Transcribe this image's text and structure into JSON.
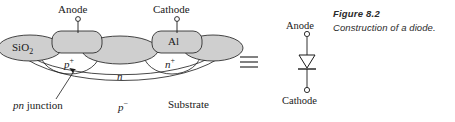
{
  "figure": {
    "caption_title": "Figure 8.2",
    "caption_text": "Construction of a diode."
  },
  "equivalence_symbol": "≡",
  "cross_section": {
    "terminals": [
      {
        "name": "anode",
        "label": "Anode"
      },
      {
        "name": "cathode",
        "label": "Cathode"
      }
    ],
    "regions": [
      {
        "name": "oxide-left",
        "label": "SiO",
        "subscript": "2"
      },
      {
        "name": "metal-anode",
        "label": ""
      },
      {
        "name": "p-plus",
        "label": "p",
        "superscript": "+"
      },
      {
        "name": "n-region",
        "label": "n"
      },
      {
        "name": "metal-cathode",
        "label": "Al"
      },
      {
        "name": "n-plus",
        "label": "n",
        "superscript": "+"
      },
      {
        "name": "p-minus",
        "label": "p",
        "superscript": "−"
      }
    ],
    "annotations": [
      {
        "name": "pn-junction",
        "label_italic": "pn",
        "label_rest": " junction"
      },
      {
        "name": "substrate",
        "label": "Substrate"
      }
    ]
  },
  "schematic": {
    "anode_label": "Anode",
    "cathode_label": "Cathode",
    "symbol": "diode"
  },
  "colors": {
    "fill_gray": "#cfcfcf",
    "stroke": "#1a1a1a",
    "background": "#ffffff",
    "caption": "#2b2b2b"
  }
}
